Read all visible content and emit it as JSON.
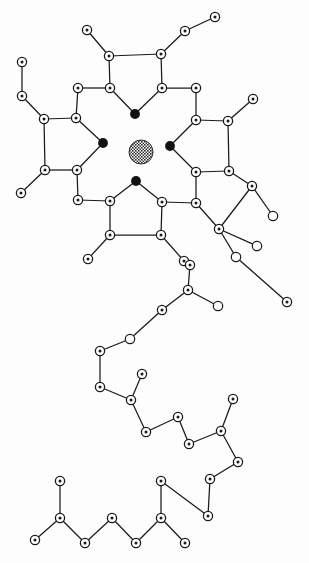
{
  "figure": {
    "title": "",
    "caption": "",
    "background_color": "#fdfdfd",
    "line_color": "#1a1a1a",
    "node_fill": "#ffffff",
    "node_dot_color": "#1a1a1a",
    "filled_node_color": "#111111",
    "core_color": "#3a3a3a",
    "width": 309,
    "height": 563
  },
  "chart_data": {
    "type": "scatter",
    "title": "",
    "xlabel": "",
    "ylabel": "",
    "xlim": [
      0,
      309
    ],
    "ylim": [
      0,
      563
    ],
    "grid": false,
    "legend": "none",
    "node_types": [
      {
        "name": "ringed-atom",
        "style": "open circle with center dot",
        "radius": 4.6,
        "count": 63
      },
      {
        "name": "open-atom",
        "style": "plain open circle, no center dot",
        "radius": 4.6,
        "count": 5
      },
      {
        "name": "filled-atom",
        "style": "solid black disc",
        "radius": 4.8,
        "count": 4
      },
      {
        "name": "core-atom",
        "style": "hatched / cross-hatched disc",
        "radius": 12,
        "count": 1
      }
    ],
    "nodes": [
      {
        "id": "core",
        "x": 141,
        "y": 152,
        "type": "core"
      },
      {
        "id": "f_top",
        "x": 135,
        "y": 114,
        "type": "filled"
      },
      {
        "id": "f_left",
        "x": 103,
        "y": 143,
        "type": "filled"
      },
      {
        "id": "f_right",
        "x": 170,
        "y": 146,
        "type": "filled"
      },
      {
        "id": "f_bottom",
        "x": 136,
        "y": 181,
        "type": "filled"
      },
      {
        "id": "tp1",
        "x": 109,
        "y": 56,
        "type": "ringed"
      },
      {
        "id": "tp2",
        "x": 161,
        "y": 54,
        "type": "ringed"
      },
      {
        "id": "tp3",
        "x": 110,
        "y": 88,
        "type": "ringed"
      },
      {
        "id": "tp4",
        "x": 162,
        "y": 88,
        "type": "ringed"
      },
      {
        "id": "tp_s1",
        "x": 87,
        "y": 30,
        "type": "ringed"
      },
      {
        "id": "tp_s2",
        "x": 185,
        "y": 31,
        "type": "ringed"
      },
      {
        "id": "tp_s3",
        "x": 215,
        "y": 17,
        "type": "ringed"
      },
      {
        "id": "lp1",
        "x": 78,
        "y": 88,
        "type": "ringed"
      },
      {
        "id": "lp2",
        "x": 76,
        "y": 118,
        "type": "ringed"
      },
      {
        "id": "lp3",
        "x": 44,
        "y": 119,
        "type": "ringed"
      },
      {
        "id": "lp4",
        "x": 45,
        "y": 170,
        "type": "ringed"
      },
      {
        "id": "lp5",
        "x": 77,
        "y": 170,
        "type": "ringed"
      },
      {
        "id": "lp_s1",
        "x": 22,
        "y": 96,
        "type": "ringed"
      },
      {
        "id": "lp_s2",
        "x": 22,
        "y": 62,
        "type": "ringed"
      },
      {
        "id": "lp_s3",
        "x": 21,
        "y": 193,
        "type": "ringed"
      },
      {
        "id": "lp_s4",
        "x": 78,
        "y": 200,
        "type": "ringed"
      },
      {
        "id": "rp1",
        "x": 196,
        "y": 88,
        "type": "ringed"
      },
      {
        "id": "rp2",
        "x": 196,
        "y": 120,
        "type": "ringed"
      },
      {
        "id": "rp3",
        "x": 228,
        "y": 121,
        "type": "ringed"
      },
      {
        "id": "rp4",
        "x": 229,
        "y": 171,
        "type": "ringed"
      },
      {
        "id": "rp5",
        "x": 196,
        "y": 172,
        "type": "ringed"
      },
      {
        "id": "rp_s1",
        "x": 253,
        "y": 99,
        "type": "ringed"
      },
      {
        "id": "rp_s2",
        "x": 196,
        "y": 203,
        "type": "ringed"
      },
      {
        "id": "bp1",
        "x": 110,
        "y": 201,
        "type": "ringed"
      },
      {
        "id": "bp2",
        "x": 162,
        "y": 202,
        "type": "ringed"
      },
      {
        "id": "bp3",
        "x": 110,
        "y": 235,
        "type": "ringed"
      },
      {
        "id": "bp4",
        "x": 161,
        "y": 235,
        "type": "ringed"
      },
      {
        "id": "bp_s1",
        "x": 88,
        "y": 259,
        "type": "ringed"
      },
      {
        "id": "bp_s2",
        "x": 184,
        "y": 261,
        "type": "ringed"
      },
      {
        "id": "rb1",
        "x": 252,
        "y": 186,
        "type": "ringed"
      },
      {
        "id": "rb2",
        "x": 273,
        "y": 216,
        "type": "open"
      },
      {
        "id": "rb3",
        "x": 219,
        "y": 229,
        "type": "ringed"
      },
      {
        "id": "rb4",
        "x": 257,
        "y": 246,
        "type": "open"
      },
      {
        "id": "rb5",
        "x": 236,
        "y": 257,
        "type": "open"
      },
      {
        "id": "rb6",
        "x": 287,
        "y": 302,
        "type": "ringed"
      },
      {
        "id": "c1",
        "x": 190,
        "y": 265,
        "type": "ringed"
      },
      {
        "id": "c2",
        "x": 188,
        "y": 290,
        "type": "ringed"
      },
      {
        "id": "c3",
        "x": 218,
        "y": 306,
        "type": "open"
      },
      {
        "id": "c4",
        "x": 162,
        "y": 310,
        "type": "ringed"
      },
      {
        "id": "c5",
        "x": 130,
        "y": 339,
        "type": "open"
      },
      {
        "id": "c6",
        "x": 100,
        "y": 351,
        "type": "ringed"
      },
      {
        "id": "c7",
        "x": 100,
        "y": 387,
        "type": "ringed"
      },
      {
        "id": "c8",
        "x": 131,
        "y": 400,
        "type": "ringed"
      },
      {
        "id": "c9",
        "x": 142,
        "y": 374,
        "type": "ringed"
      },
      {
        "id": "c10",
        "x": 146,
        "y": 432,
        "type": "ringed"
      },
      {
        "id": "c11",
        "x": 178,
        "y": 417,
        "type": "ringed"
      },
      {
        "id": "c12",
        "x": 189,
        "y": 444,
        "type": "ringed"
      },
      {
        "id": "c13",
        "x": 221,
        "y": 431,
        "type": "ringed"
      },
      {
        "id": "c14",
        "x": 233,
        "y": 399,
        "type": "ringed"
      },
      {
        "id": "c15",
        "x": 238,
        "y": 462,
        "type": "ringed"
      },
      {
        "id": "c16",
        "x": 210,
        "y": 479,
        "type": "ringed"
      },
      {
        "id": "c17",
        "x": 208,
        "y": 516,
        "type": "ringed"
      },
      {
        "id": "b1",
        "x": 35,
        "y": 540,
        "type": "ringed"
      },
      {
        "id": "b2",
        "x": 60,
        "y": 518,
        "type": "ringed"
      },
      {
        "id": "b3",
        "x": 60,
        "y": 481,
        "type": "ringed"
      },
      {
        "id": "b4",
        "x": 85,
        "y": 543,
        "type": "ringed"
      },
      {
        "id": "b5",
        "x": 112,
        "y": 518,
        "type": "ringed"
      },
      {
        "id": "b6",
        "x": 136,
        "y": 543,
        "type": "ringed"
      },
      {
        "id": "b7",
        "x": 161,
        "y": 518,
        "type": "ringed"
      },
      {
        "id": "b8",
        "x": 161,
        "y": 481,
        "type": "ringed"
      },
      {
        "id": "b9",
        "x": 185,
        "y": 543,
        "type": "ringed"
      }
    ],
    "edges": [
      [
        "tp3",
        "tp1"
      ],
      [
        "tp4",
        "tp2"
      ],
      [
        "tp1",
        "tp2"
      ],
      [
        "tp1",
        "tp_s1"
      ],
      [
        "tp2",
        "tp_s2"
      ],
      [
        "tp_s2",
        "tp_s3"
      ],
      [
        "tp3",
        "f_top"
      ],
      [
        "tp4",
        "f_top"
      ],
      [
        "tp3",
        "lp1"
      ],
      [
        "tp4",
        "rp1"
      ],
      [
        "lp1",
        "lp2"
      ],
      [
        "lp2",
        "lp3"
      ],
      [
        "lp3",
        "lp4"
      ],
      [
        "lp4",
        "lp5"
      ],
      [
        "lp5",
        "f_left"
      ],
      [
        "lp2",
        "f_left"
      ],
      [
        "lp3",
        "lp_s1"
      ],
      [
        "lp_s1",
        "lp_s2"
      ],
      [
        "lp4",
        "lp_s3"
      ],
      [
        "lp5",
        "lp_s4"
      ],
      [
        "rp1",
        "rp2"
      ],
      [
        "rp2",
        "rp3"
      ],
      [
        "rp3",
        "rp4"
      ],
      [
        "rp4",
        "rp5"
      ],
      [
        "rp5",
        "f_right"
      ],
      [
        "rp2",
        "f_right"
      ],
      [
        "rp3",
        "rp_s1"
      ],
      [
        "rp5",
        "rp_s2"
      ],
      [
        "lp_s4",
        "bp1"
      ],
      [
        "rp_s2",
        "bp2"
      ],
      [
        "bp1",
        "f_bottom"
      ],
      [
        "bp2",
        "f_bottom"
      ],
      [
        "bp1",
        "bp3"
      ],
      [
        "bp2",
        "bp4"
      ],
      [
        "bp3",
        "bp4"
      ],
      [
        "bp3",
        "bp_s1"
      ],
      [
        "bp4",
        "bp_s2"
      ],
      [
        "rp4",
        "rb1"
      ],
      [
        "rb1",
        "rb2"
      ],
      [
        "rb1",
        "rb3"
      ],
      [
        "rb3",
        "rb4"
      ],
      [
        "rb3",
        "rb5"
      ],
      [
        "rb5",
        "rb6"
      ],
      [
        "rp_s2",
        "rb3"
      ],
      [
        "bp_s2",
        "c1"
      ],
      [
        "c1",
        "c2"
      ],
      [
        "c2",
        "c3"
      ],
      [
        "c2",
        "c4"
      ],
      [
        "c4",
        "c5"
      ],
      [
        "c5",
        "c6"
      ],
      [
        "c6",
        "c7"
      ],
      [
        "c7",
        "c8"
      ],
      [
        "c8",
        "c9"
      ],
      [
        "c8",
        "c10"
      ],
      [
        "c10",
        "c11"
      ],
      [
        "c11",
        "c12"
      ],
      [
        "c12",
        "c13"
      ],
      [
        "c13",
        "c14"
      ],
      [
        "c13",
        "c15"
      ],
      [
        "c15",
        "c16"
      ],
      [
        "c16",
        "c17"
      ],
      [
        "c17",
        "b8"
      ],
      [
        "b1",
        "b2"
      ],
      [
        "b2",
        "b3"
      ],
      [
        "b2",
        "b4"
      ],
      [
        "b4",
        "b5"
      ],
      [
        "b5",
        "b6"
      ],
      [
        "b6",
        "b7"
      ],
      [
        "b7",
        "b8"
      ],
      [
        "b7",
        "b9"
      ]
    ]
  }
}
